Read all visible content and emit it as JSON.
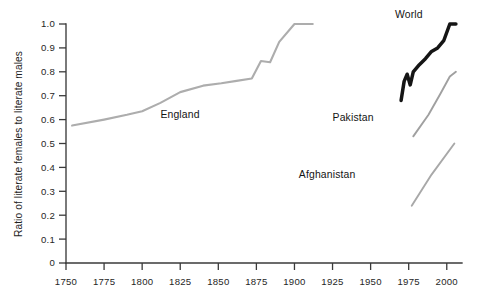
{
  "chart_data": {
    "type": "line",
    "title": "",
    "subtitle": "",
    "xlabel": "",
    "ylabel": "Ratio of literate females to literate males",
    "xlim": [
      1750,
      2010
    ],
    "ylim": [
      0,
      1.0
    ],
    "grid": false,
    "legend_position": "inline-labels",
    "x_ticks": [
      "1750",
      "1775",
      "1800",
      "1825",
      "1850",
      "1875",
      "1900",
      "1925",
      "1950",
      "1975",
      "2000"
    ],
    "x_tick_values": [
      1750,
      1775,
      1800,
      1825,
      1850,
      1875,
      1900,
      1925,
      1950,
      1975,
      2000
    ],
    "y_ticks": [
      "0",
      "0.1",
      "0.2",
      "0.3",
      "0.4",
      "0.5",
      "0.6",
      "0.7",
      "0.8",
      "0.9",
      "1.0"
    ],
    "y_tick_values": [
      0,
      0.1,
      0.2,
      0.3,
      0.4,
      0.5,
      0.6,
      0.7,
      0.8,
      0.9,
      1.0
    ],
    "series": [
      {
        "name": "England",
        "color": "#adadad",
        "label": "England",
        "x": [
          1754,
          1775,
          1790,
          1800,
          1812,
          1825,
          1840,
          1852,
          1862,
          1872,
          1878,
          1884,
          1890,
          1900,
          1912
        ],
        "values": [
          0.575,
          0.6,
          0.62,
          0.635,
          0.67,
          0.715,
          0.742,
          0.752,
          0.762,
          0.772,
          0.845,
          0.84,
          0.925,
          1.0,
          1.0
        ]
      },
      {
        "name": "World",
        "color": "#151515",
        "label": "World",
        "x": [
          1970,
          1972,
          1974,
          1976,
          1978,
          1982,
          1986,
          1990,
          1994,
          1998,
          2002,
          2006
        ],
        "values": [
          0.68,
          0.76,
          0.79,
          0.745,
          0.8,
          0.83,
          0.855,
          0.885,
          0.9,
          0.93,
          1.0,
          1.0
        ]
      },
      {
        "name": "Pakistan",
        "color": "#a0a0a0",
        "label": "Pakistan",
        "x": [
          1978,
          1988,
          1996,
          2002,
          2006
        ],
        "values": [
          0.53,
          0.62,
          0.71,
          0.78,
          0.8
        ]
      },
      {
        "name": "Afghanistan",
        "color": "#a8a8a8",
        "label": "Afghanistan",
        "x": [
          1977,
          1990,
          2005
        ],
        "values": [
          0.24,
          0.37,
          0.5
        ]
      }
    ],
    "annotations": [
      {
        "text": "England",
        "x": 1812,
        "y": 0.605
      },
      {
        "text": "World",
        "x": 1966,
        "y": 1.025
      },
      {
        "text": "Pakistan",
        "x": 1952,
        "y": 0.595
      },
      {
        "text": "Afghanistan",
        "x": 1940,
        "y": 0.355
      }
    ]
  },
  "axis": {
    "y_title": "Ratio of literate females to literate males"
  }
}
